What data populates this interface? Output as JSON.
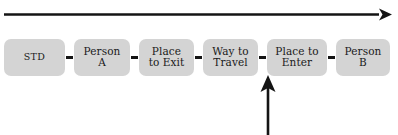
{
  "diagram": {
    "title_visible": false,
    "background_color": "#ffffff",
    "box_fill_color": "#d4d4d4",
    "line_color": "#141414",
    "text_color": "#1a1a1a",
    "timeline_arrow": {
      "name": "time-axis-arrow",
      "direction": "right",
      "label": ""
    },
    "focus_arrow": {
      "name": "highlight-pointer-arrow",
      "direction": "up",
      "label": "",
      "points_at": "Place to Enter"
    },
    "stages": [
      {
        "label": "STD",
        "style": "small"
      },
      {
        "label": "Person\nA",
        "style": "normal"
      },
      {
        "label": "Place\nto Exit",
        "style": "normal"
      },
      {
        "label": "Way to\nTravel",
        "style": "normal"
      },
      {
        "label": "Place to\nEnter",
        "style": "normal"
      },
      {
        "label": "Person\nB",
        "style": "normal"
      }
    ],
    "connector_symbol": "-"
  }
}
